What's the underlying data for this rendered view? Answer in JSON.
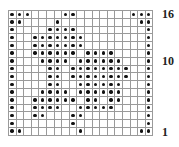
{
  "chart_data": {
    "type": "heatmap",
    "title": "",
    "columns": 19,
    "rows": 16,
    "row_labels_shown": {
      "16": "16",
      "10": "10",
      "1": "1"
    },
    "legend": {
      "dot": "filled stitch",
      "empty": "blank stitch"
    },
    "filled_cells_by_row": {
      "16": [
        0,
        1,
        2,
        7,
        8,
        16,
        17,
        18
      ],
      "15": [
        0,
        1,
        6,
        17,
        18
      ],
      "14": [
        0,
        5,
        6,
        7,
        8,
        18
      ],
      "13": [
        0,
        3,
        4,
        5,
        6,
        7,
        8,
        9,
        18
      ],
      "12": [
        0,
        3,
        4,
        5,
        6,
        7,
        8,
        9,
        18
      ],
      "11": [
        0,
        3,
        4,
        5,
        6,
        7,
        8,
        10,
        11,
        12,
        13,
        18
      ],
      "10": [
        0,
        4,
        5,
        6,
        7,
        9,
        10,
        11,
        12,
        13,
        14,
        18
      ],
      "9": [
        0,
        5,
        6,
        8,
        9,
        10,
        11,
        12,
        13,
        14,
        15,
        18
      ],
      "8": [
        0,
        5,
        6,
        8,
        9,
        10,
        11,
        12,
        13,
        14,
        15,
        18
      ],
      "7": [
        0,
        5,
        6,
        9,
        10,
        11,
        12,
        13,
        14,
        18
      ],
      "6": [
        0,
        4,
        5,
        6,
        7,
        9,
        10,
        11,
        12,
        13,
        14,
        18
      ],
      "5": [
        0,
        3,
        4,
        5,
        6,
        7,
        8,
        10,
        11,
        13,
        14,
        18
      ],
      "4": [
        0,
        3,
        4,
        5,
        6,
        9,
        10,
        11,
        12,
        13,
        18
      ],
      "3": [
        0,
        3,
        4,
        8,
        9,
        18
      ],
      "2": [
        0,
        8,
        18
      ],
      "1": [
        0,
        1,
        9,
        17,
        18
      ]
    }
  },
  "labels": {
    "row16": "16",
    "row10": "10",
    "row1": "1"
  },
  "colors": {
    "grid_line": "#9a9a9a",
    "dot": "#111111",
    "background": "#ffffff"
  }
}
